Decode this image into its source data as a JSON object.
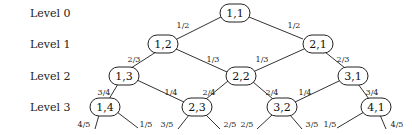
{
  "levels": [
    {
      "label": "Level 0",
      "x": 30,
      "y": 13
    },
    {
      "label": "Level 1",
      "x": 30,
      "y": 44
    },
    {
      "label": "Level 2",
      "x": 30,
      "y": 76
    },
    {
      "label": "Level 3",
      "x": 30,
      "y": 107
    }
  ],
  "nodes": [
    {
      "id": "n11",
      "label": "1,1",
      "x": 235,
      "y": 13
    },
    {
      "id": "n12",
      "label": "1,2",
      "x": 163,
      "y": 44
    },
    {
      "id": "n21",
      "label": "2,1",
      "x": 318,
      "y": 44
    },
    {
      "id": "n13",
      "label": "1,3",
      "x": 124,
      "y": 76
    },
    {
      "id": "n22",
      "label": "2,2",
      "x": 241,
      "y": 76
    },
    {
      "id": "n31",
      "label": "3,1",
      "x": 353,
      "y": 76
    },
    {
      "id": "n14",
      "label": "1,4",
      "x": 105,
      "y": 107
    },
    {
      "id": "n23",
      "label": "2,3",
      "x": 197,
      "y": 107
    },
    {
      "id": "n32",
      "label": "3,2",
      "x": 282,
      "y": 107
    },
    {
      "id": "n41",
      "label": "4,1",
      "x": 376,
      "y": 107
    }
  ],
  "edges": [
    {
      "x1": 221,
      "y1": 17,
      "x2": 177,
      "y2": 39,
      "label": "1/2",
      "lx": 183,
      "ly": 25
    },
    {
      "x1": 249,
      "y1": 17,
      "x2": 303,
      "y2": 39,
      "label": "1/2",
      "lx": 294,
      "ly": 25
    },
    {
      "x1": 156,
      "y1": 52,
      "x2": 131,
      "y2": 68,
      "label": "2/3",
      "lx": 134,
      "ly": 59
    },
    {
      "x1": 176,
      "y1": 49,
      "x2": 227,
      "y2": 72,
      "label": "1/3",
      "lx": 213,
      "ly": 59
    },
    {
      "x1": 304,
      "y1": 49,
      "x2": 255,
      "y2": 71,
      "label": "1/3",
      "lx": 262,
      "ly": 59
    },
    {
      "x1": 325,
      "y1": 52,
      "x2": 345,
      "y2": 68,
      "label": "2/3",
      "lx": 343,
      "ly": 59
    },
    {
      "x1": 118,
      "y1": 84,
      "x2": 109,
      "y2": 99,
      "label": "3/4",
      "lx": 104,
      "ly": 92
    },
    {
      "x1": 137,
      "y1": 80,
      "x2": 184,
      "y2": 102,
      "label": "1/4",
      "lx": 171,
      "ly": 92
    },
    {
      "x1": 228,
      "y1": 81,
      "x2": 206,
      "y2": 99,
      "label": "2/4",
      "lx": 209,
      "ly": 92
    },
    {
      "x1": 253,
      "y1": 82,
      "x2": 273,
      "y2": 99,
      "label": "2/4",
      "lx": 272,
      "ly": 92
    },
    {
      "x1": 339,
      "y1": 81,
      "x2": 295,
      "y2": 102,
      "label": "1/4",
      "lx": 305,
      "ly": 92
    },
    {
      "x1": 358,
      "y1": 84,
      "x2": 369,
      "y2": 99,
      "label": "3/4",
      "lx": 372,
      "ly": 92
    },
    {
      "x1": 99,
      "y1": 115,
      "x2": 95,
      "y2": 129,
      "label": "4/5",
      "lx": 84,
      "ly": 124
    },
    {
      "x1": 117,
      "y1": 112,
      "x2": 138,
      "y2": 128,
      "label": "1/5",
      "lx": 146,
      "ly": 124
    },
    {
      "x1": 189,
      "y1": 115,
      "x2": 178,
      "y2": 129,
      "label": "3/5",
      "lx": 167,
      "ly": 124
    },
    {
      "x1": 206,
      "y1": 115,
      "x2": 220,
      "y2": 129,
      "label": "2/5",
      "lx": 230,
      "ly": 124
    },
    {
      "x1": 272,
      "y1": 115,
      "x2": 257,
      "y2": 129,
      "label": "2/5",
      "lx": 247,
      "ly": 124
    },
    {
      "x1": 290,
      "y1": 115,
      "x2": 302,
      "y2": 129,
      "label": "3/5",
      "lx": 312,
      "ly": 124
    },
    {
      "x1": 364,
      "y1": 112,
      "x2": 337,
      "y2": 128,
      "label": "1/5",
      "lx": 330,
      "ly": 124
    },
    {
      "x1": 380,
      "y1": 115,
      "x2": 386,
      "y2": 129,
      "label": "4/5",
      "lx": 397,
      "ly": 124
    }
  ]
}
